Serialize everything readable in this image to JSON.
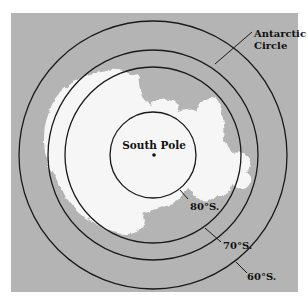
{
  "map": {
    "title": "Antarctica polar projection",
    "colors": {
      "ocean": "#b4b4b4",
      "land": "#f6f6f6",
      "line": "#1a1a1a",
      "background": "#ffffff"
    },
    "labels": {
      "pole": "South Pole",
      "circle_line1": "Antarctic",
      "circle_line2": "Circle",
      "lat80": "80°S.",
      "lat70": "70°S.",
      "lat60": "60°S."
    },
    "circles": [
      {
        "name": "80°S.",
        "r": 43
      },
      {
        "name": "70°S.",
        "r": 88
      },
      {
        "name": "Antarctic Circle",
        "r": 105
      },
      {
        "name": "60°S.",
        "r": 134
      }
    ]
  }
}
